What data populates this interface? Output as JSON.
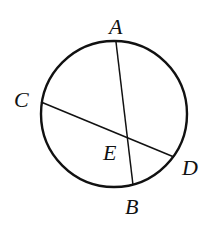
{
  "diagram": {
    "title": "",
    "type": "geometry-circle-chords",
    "circle": {
      "cx": 114,
      "cy": 114,
      "r": 73,
      "stroke": "#111111"
    },
    "points": [
      {
        "name": "A",
        "x": 116,
        "y": 42,
        "label": "A",
        "label_x": 109,
        "label_y": 34
      },
      {
        "name": "B",
        "x": 133,
        "y": 185,
        "label": "B",
        "label_x": 125,
        "label_y": 214
      },
      {
        "name": "C",
        "x": 41,
        "y": 102,
        "label": "C",
        "label_x": 14,
        "label_y": 107
      },
      {
        "name": "D",
        "x": 174,
        "y": 157,
        "label": "D",
        "label_x": 182,
        "label_y": 175
      },
      {
        "name": "E",
        "x": 127,
        "y": 137,
        "label": "E",
        "label_x": 103,
        "label_y": 160
      }
    ],
    "chords": [
      {
        "name": "AB",
        "from": "A",
        "to": "B"
      },
      {
        "name": "CD",
        "from": "C",
        "to": "D"
      }
    ],
    "labels": {
      "A": "A",
      "B": "B",
      "C": "C",
      "D": "D",
      "E": "E"
    }
  }
}
